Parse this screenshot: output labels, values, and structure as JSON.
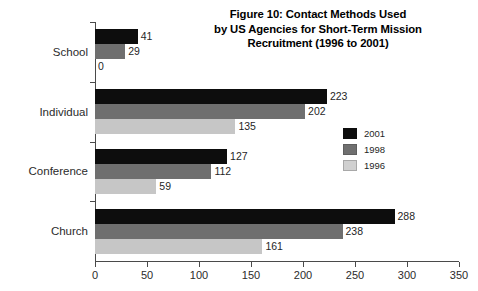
{
  "chart_data": {
    "type": "bar",
    "orientation": "horizontal",
    "title": "Figure 10: Contact Methods Used by US Agencies for Short-Term Mission Recruitment (1996 to 2001)",
    "title_lines": [
      "Figure 10: Contact Methods Used",
      "by US Agencies for Short-Term Mission",
      "Recruitment (1996 to 2001)"
    ],
    "categories": [
      "School",
      "Individual",
      "Conference",
      "Church"
    ],
    "series": [
      {
        "name": "2001",
        "color": "#0d0d0d",
        "values": [
          41,
          223,
          127,
          288
        ]
      },
      {
        "name": "1998",
        "color": "#6f6f6f",
        "values": [
          29,
          202,
          112,
          238
        ]
      },
      {
        "name": "1996",
        "color": "#c6c6c6",
        "values": [
          0,
          135,
          59,
          161
        ]
      }
    ],
    "xlabel": "",
    "ylabel": "",
    "xlim": [
      0,
      350
    ],
    "xticks": [
      0,
      50,
      100,
      150,
      200,
      250,
      300,
      350
    ],
    "xtick_labels": [
      "0",
      "50",
      "100",
      "150",
      "200",
      "250",
      "300",
      "350"
    ],
    "grid": false,
    "legend_position": "center-right",
    "legend_entries": [
      "2001",
      "1998",
      "1996"
    ],
    "value_labels": {
      "School": [
        "41",
        "29",
        "0"
      ],
      "Individual": [
        "223",
        "202",
        "135"
      ],
      "Conference": [
        "127",
        "112",
        "59"
      ],
      "Church": [
        "288",
        "238",
        "161"
      ]
    }
  }
}
